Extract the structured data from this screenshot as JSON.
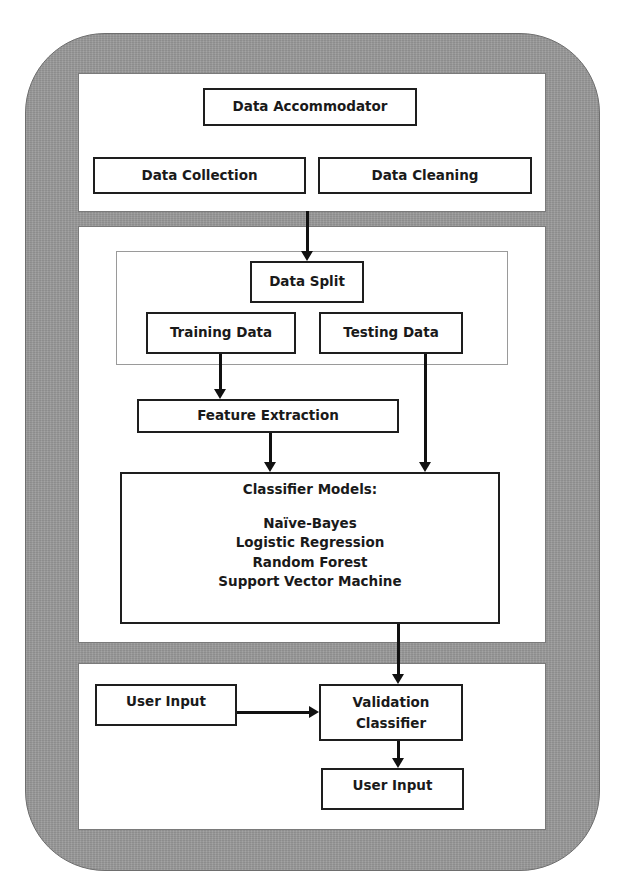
{
  "diagram": {
    "top_panel": {
      "header_box": "Data Accommodator",
      "boxes": [
        "Data Collection",
        "Data Cleaning"
      ]
    },
    "middle_panel": {
      "data_split": {
        "header_box": "Data Split",
        "boxes": [
          "Training Data",
          "Testing Data"
        ]
      },
      "feature_extraction": "Feature Extraction",
      "classifier": {
        "title": "Classifier Models:",
        "models": [
          "Naïve-Bayes",
          "Logistic Regression",
          "Random Forest",
          "Support Vector Machine"
        ]
      }
    },
    "bottom_panel": {
      "user_input_source": "User Input",
      "validation": [
        "Validation",
        "Classifier"
      ],
      "user_input_output": "User Input"
    },
    "colors": {
      "frame_gray": "#9a9a9a",
      "panel_white": "#ffffff",
      "stroke_black": "#111111"
    },
    "edges": [
      {
        "from": "Data Accommodator section",
        "to": "Data Split"
      },
      {
        "from": "Training Data",
        "to": "Feature Extraction"
      },
      {
        "from": "Feature Extraction",
        "to": "Classifier Models"
      },
      {
        "from": "Testing Data",
        "to": "Classifier Models"
      },
      {
        "from": "Classifier Models",
        "to": "Validation Classifier"
      },
      {
        "from": "User Input",
        "to": "Validation Classifier"
      },
      {
        "from": "Validation Classifier",
        "to": "User Input (output)"
      }
    ]
  }
}
